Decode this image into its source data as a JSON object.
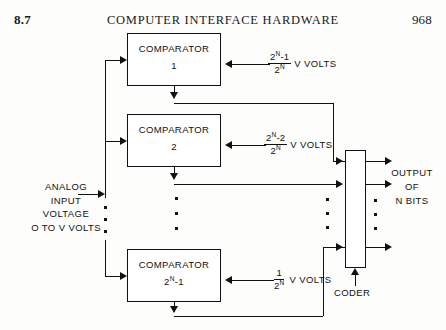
{
  "header": {
    "section": "8.7",
    "title": "COMPUTER INTERFACE HARDWARE",
    "page": "968"
  },
  "input_label": {
    "line1": "ANALOG",
    "line2": "INPUT",
    "line3": "VOLTAGE",
    "line4": "O TO V VOLTS"
  },
  "comparators": [
    {
      "name": "COMPARATOR",
      "index": "1",
      "ref_numerator": "2N-1",
      "ref_denominator": "2N",
      "ref_unit": "V VOLTS"
    },
    {
      "name": "COMPARATOR",
      "index": "2",
      "ref_numerator": "2N-2",
      "ref_denominator": "2N",
      "ref_unit": "V VOLTS"
    },
    {
      "name": "COMPARATOR",
      "index": "2N-1",
      "ref_numerator": "1",
      "ref_denominator": "2N",
      "ref_unit": "V VOLTS"
    }
  ],
  "coder": {
    "label": "CODER"
  },
  "output_label": {
    "line1": "OUTPUT",
    "line2": "OF",
    "line3": "N BITS"
  },
  "colors": {
    "ink": "#111111",
    "paper": "#fdfdfb"
  }
}
